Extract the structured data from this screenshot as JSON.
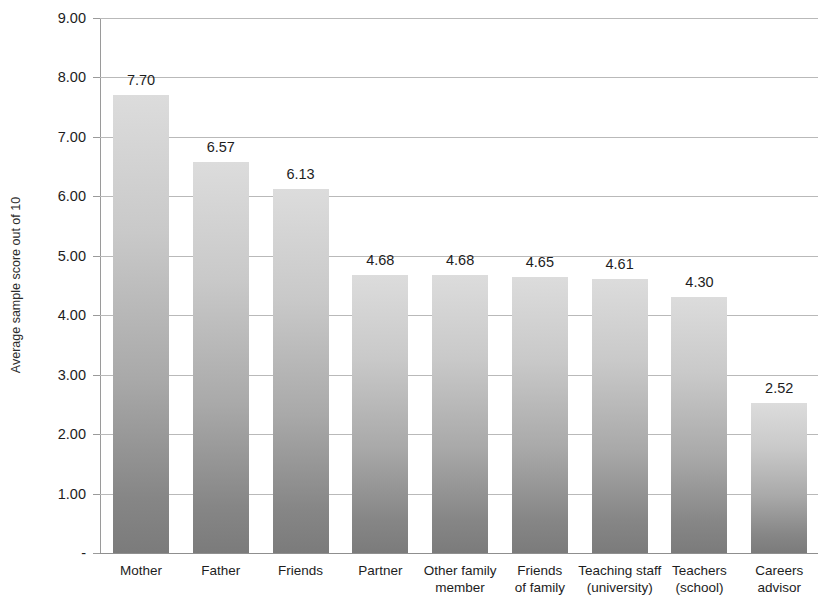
{
  "chart_data": {
    "type": "bar",
    "title": "",
    "xlabel": "",
    "ylabel": "Average sample score out of 10",
    "ylim": [
      0,
      9
    ],
    "grid": true,
    "legend": "none",
    "orientation": "vertical",
    "categories": [
      "Mother",
      "Father",
      "Friends",
      "Partner",
      "Other family member",
      "Friends of family",
      "Teaching staff (university)",
      "Teachers (school)",
      "Careers advisor"
    ],
    "category_lines": [
      [
        "Mother"
      ],
      [
        "Father"
      ],
      [
        "Friends"
      ],
      [
        "Partner"
      ],
      [
        "Other family",
        "member"
      ],
      [
        "Friends",
        "of family"
      ],
      [
        "Teaching staff",
        "(university)"
      ],
      [
        "Teachers",
        "(school)"
      ],
      [
        "Careers",
        "advisor"
      ]
    ],
    "values": [
      7.7,
      6.57,
      6.13,
      4.68,
      4.68,
      4.65,
      4.61,
      4.3,
      2.52
    ],
    "value_labels": [
      "7.70",
      "6.57",
      "6.13",
      "4.68",
      "4.68",
      "4.65",
      "4.61",
      "4.30",
      "2.52"
    ],
    "y_ticks": [
      9,
      8,
      7,
      6,
      5,
      4,
      3,
      2,
      1,
      0
    ],
    "y_tick_labels": [
      "9.00",
      "8.00",
      "7.00",
      "6.00",
      "5.00",
      "4.00",
      "3.00",
      "2.00",
      "1.00",
      "-"
    ],
    "colors": {
      "bar_top": "#dcdcdc",
      "bar_bottom": "#7b7b7b",
      "gridline": "#b9b9b9",
      "axis": "#9a9a9a",
      "text": "#1d1d1d"
    }
  }
}
